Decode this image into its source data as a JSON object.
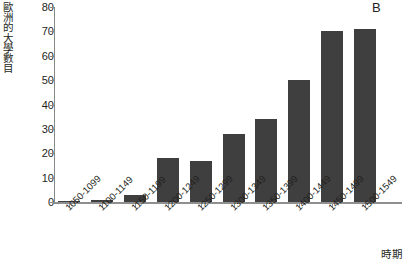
{
  "panel": {
    "label": "B"
  },
  "axes": {
    "y_title_chars": [
      "歐",
      "洲",
      "的",
      "大",
      "學",
      "數",
      "目"
    ],
    "y_title": "歐洲的大學數目",
    "x_title": "時期",
    "y_ticks": [
      0,
      10,
      20,
      30,
      40,
      50,
      60,
      70,
      80
    ]
  },
  "colors": {
    "bar": "#3f3f3f",
    "axis": "#8f8f8f",
    "text": "#231f20",
    "background": "#ffffff"
  },
  "chart_data": {
    "type": "bar",
    "title": "B",
    "xlabel": "時期",
    "ylabel": "歐洲的大學數目",
    "ylim": [
      0,
      80
    ],
    "ytick_step": 10,
    "grid": false,
    "legend": null,
    "categories": [
      "1050-1099",
      "1100-1149",
      "1150-1199",
      "1200-1249",
      "1250-1299",
      "1300-1349",
      "1350-1399",
      "1400-1449",
      "1450-1499",
      "1500-1549"
    ],
    "values": [
      0,
      1,
      3,
      18,
      17,
      28,
      34,
      50,
      70,
      71
    ]
  }
}
